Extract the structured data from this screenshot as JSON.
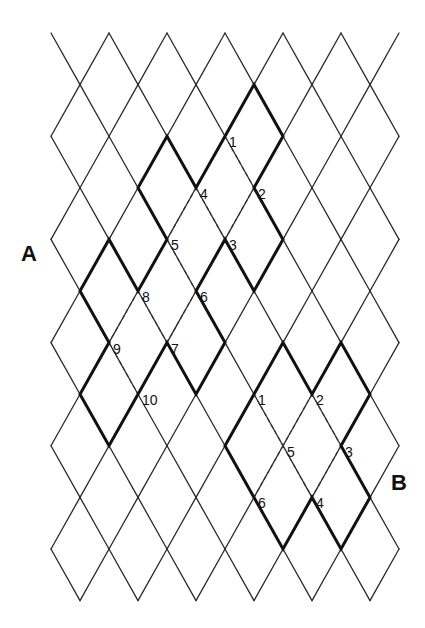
{
  "grid": {
    "origin_x": 51,
    "origin_y": 33,
    "step_x": 29,
    "step_y": 51.6,
    "cols": 12,
    "rows": 11,
    "line_color": "#2a2a2a"
  },
  "region_labels": [
    {
      "id": "A",
      "text": "A",
      "x": 29,
      "y": 261
    },
    {
      "id": "B",
      "text": "B",
      "x": 399,
      "y": 490
    }
  ],
  "figures": [
    {
      "name": "figure-a",
      "thick_path": [
        [
          6,
          2
        ],
        [
          7,
          1
        ],
        [
          8,
          2
        ],
        [
          7,
          3
        ],
        [
          8,
          4
        ],
        [
          7,
          5
        ],
        [
          6,
          4
        ],
        [
          5,
          5
        ],
        [
          6,
          6
        ],
        [
          5,
          7
        ],
        [
          4,
          6
        ],
        [
          3,
          7
        ],
        [
          2,
          8
        ],
        [
          1,
          7
        ],
        [
          2,
          6
        ],
        [
          1,
          5
        ],
        [
          2,
          4
        ],
        [
          3,
          5
        ],
        [
          4,
          4
        ],
        [
          3,
          3
        ],
        [
          4,
          2
        ],
        [
          5,
          3
        ],
        [
          6,
          2
        ]
      ],
      "dashed_edges": [
        [
          [
            6,
            2
          ],
          [
            7,
            3
          ]
        ],
        [
          [
            7,
            3
          ],
          [
            6,
            4
          ]
        ],
        [
          [
            5,
            3
          ],
          [
            6,
            4
          ]
        ],
        [
          [
            5,
            3
          ],
          [
            4,
            4
          ]
        ],
        [
          [
            4,
            4
          ],
          [
            5,
            5
          ]
        ],
        [
          [
            3,
            5
          ],
          [
            2,
            6
          ]
        ],
        [
          [
            3,
            5
          ],
          [
            4,
            6
          ]
        ],
        [
          [
            5,
            5
          ],
          [
            4,
            6
          ]
        ],
        [
          [
            2,
            6
          ],
          [
            3,
            7
          ]
        ]
      ],
      "vertex_labels": [
        {
          "text": "1",
          "j": 6,
          "k": 2
        },
        {
          "text": "2",
          "j": 7,
          "k": 3
        },
        {
          "text": "3",
          "j": 6,
          "k": 4
        },
        {
          "text": "4",
          "j": 5,
          "k": 3
        },
        {
          "text": "5",
          "j": 4,
          "k": 4
        },
        {
          "text": "6",
          "j": 5,
          "k": 5
        },
        {
          "text": "7",
          "j": 4,
          "k": 6
        },
        {
          "text": "8",
          "j": 3,
          "k": 5
        },
        {
          "text": "9",
          "j": 2,
          "k": 6
        },
        {
          "text": "10",
          "j": 3,
          "k": 7
        }
      ]
    },
    {
      "name": "figure-b",
      "thick_path": [
        [
          7,
          7
        ],
        [
          8,
          6
        ],
        [
          9,
          7
        ],
        [
          10,
          6
        ],
        [
          11,
          7
        ],
        [
          10,
          8
        ],
        [
          11,
          9
        ],
        [
          10,
          10
        ],
        [
          9,
          9
        ],
        [
          8,
          10
        ],
        [
          7,
          9
        ],
        [
          6,
          8
        ],
        [
          7,
          7
        ]
      ],
      "dashed_edges": [
        [
          [
            7,
            7
          ],
          [
            8,
            8
          ]
        ],
        [
          [
            9,
            7
          ],
          [
            8,
            8
          ]
        ],
        [
          [
            9,
            7
          ],
          [
            10,
            8
          ]
        ],
        [
          [
            8,
            8
          ],
          [
            7,
            9
          ]
        ],
        [
          [
            8,
            8
          ],
          [
            9,
            9
          ]
        ],
        [
          [
            10,
            8
          ],
          [
            9,
            9
          ]
        ]
      ],
      "vertex_labels": [
        {
          "text": "1",
          "j": 7,
          "k": 7
        },
        {
          "text": "2",
          "j": 9,
          "k": 7
        },
        {
          "text": "3",
          "j": 10,
          "k": 8
        },
        {
          "text": "4",
          "j": 9,
          "k": 9
        },
        {
          "text": "5",
          "j": 8,
          "k": 8
        },
        {
          "text": "6",
          "j": 7,
          "k": 9
        }
      ]
    }
  ]
}
